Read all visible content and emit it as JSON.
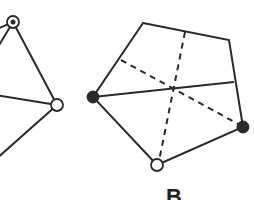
{
  "figure": {
    "stroke_color": "#2a2a2a",
    "fill_color": "#2a2a2a",
    "background": "#ffffff",
    "left_graph": {
      "vertices": [
        {
          "id": "L1",
          "x": 13,
          "y": 22,
          "style": "dotted-circle"
        },
        {
          "id": "L2",
          "x": 57,
          "y": 105,
          "style": "open-circle"
        }
      ],
      "edges": [
        {
          "x1": 13,
          "y1": 22,
          "x2": 57,
          "y2": 105,
          "style": "solid"
        },
        {
          "x1": 13,
          "y1": 22,
          "x2": -5,
          "y2": 52,
          "style": "solid"
        },
        {
          "x1": 13,
          "y1": 22,
          "x2": -5,
          "y2": 30,
          "style": "solid"
        },
        {
          "x1": -5,
          "y1": 95,
          "x2": 57,
          "y2": 105,
          "style": "solid"
        },
        {
          "x1": 57,
          "y1": 105,
          "x2": -5,
          "y2": 160,
          "style": "solid"
        }
      ]
    },
    "right_graph": {
      "label": "B",
      "polygon": [
        {
          "x": 143,
          "y": 23
        },
        {
          "x": 229,
          "y": 40
        },
        {
          "x": 243,
          "y": 127
        },
        {
          "x": 157,
          "y": 165
        },
        {
          "x": 93,
          "y": 97
        }
      ],
      "vertices": [
        {
          "id": "R1",
          "x": 93,
          "y": 97,
          "style": "filled-circle"
        },
        {
          "id": "R2",
          "x": 243,
          "y": 127,
          "style": "filled-circle"
        },
        {
          "id": "R3",
          "x": 157,
          "y": 165,
          "style": "open-circle"
        }
      ],
      "edges": [
        {
          "x1": 93,
          "y1": 97,
          "x2": 234,
          "y2": 82,
          "style": "solid"
        },
        {
          "x1": 121,
          "y1": 60,
          "x2": 240,
          "y2": 125,
          "style": "dashed"
        },
        {
          "x1": 185,
          "y1": 32,
          "x2": 159,
          "y2": 161,
          "style": "dashed"
        }
      ]
    }
  }
}
